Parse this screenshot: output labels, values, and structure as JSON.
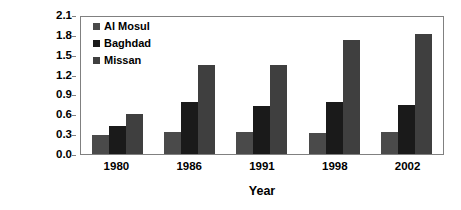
{
  "chart_data": {
    "type": "bar",
    "title": "",
    "xlabel": "Year",
    "ylabel": "Salinity (ppt)",
    "categories": [
      "1980",
      "1986",
      "1991",
      "1998",
      "2002"
    ],
    "series": [
      {
        "name": "Al Mosul",
        "color": "#4a4a4a",
        "values": [
          0.28,
          0.34,
          0.34,
          0.32,
          0.33
        ]
      },
      {
        "name": "Baghdad",
        "color": "#1a1a1a",
        "values": [
          0.42,
          0.78,
          0.72,
          0.78,
          0.74
        ]
      },
      {
        "name": "Missan",
        "color": "#3f3f3f",
        "values": [
          0.6,
          1.35,
          1.35,
          1.73,
          1.82
        ]
      }
    ],
    "ylim": [
      0.0,
      2.1
    ],
    "yticks": [
      "0.0",
      "0.3",
      "0.6",
      "0.9",
      "1.2",
      "1.5",
      "1.8",
      "2.1"
    ],
    "ytick_values": [
      0.0,
      0.3,
      0.6,
      0.9,
      1.2,
      1.5,
      1.8,
      2.1
    ],
    "grid": false,
    "legend_position": "top-left-inside",
    "plot_border_color": "#808080",
    "text_color": "#000000"
  }
}
